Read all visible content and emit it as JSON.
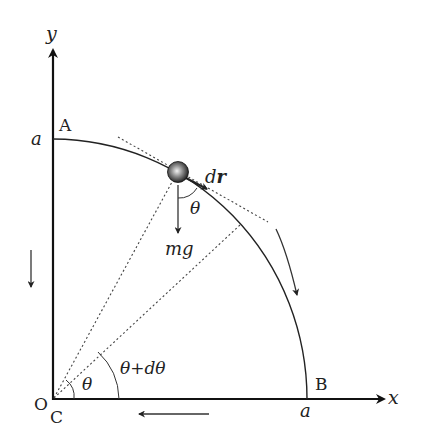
{
  "diagram": {
    "axes": {
      "x_label": "x",
      "y_label": "y",
      "origin_label": "O",
      "center_label": "C"
    },
    "points": {
      "A_label": "A",
      "B_label": "B",
      "a_on_y": "a",
      "a_on_x": "a"
    },
    "vectors": {
      "displacement_label": "dr",
      "displacement_d": "d",
      "displacement_r": "r",
      "gravity_label": "mg"
    },
    "angles": {
      "theta_at_ball": "θ",
      "theta_at_center": "θ",
      "theta_plus_dtheta": "θ+dθ"
    },
    "colors": {
      "line": "#222222",
      "dotted": "#444444",
      "ball_dark": "#111111",
      "ball_light": "#e8e8e8"
    }
  }
}
